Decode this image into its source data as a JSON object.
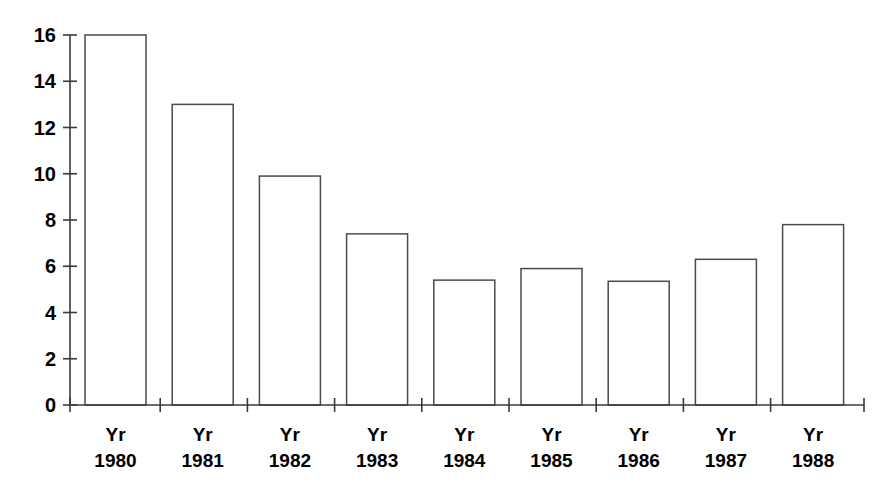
{
  "chart_data": {
    "type": "bar",
    "title": "",
    "subtitle": "",
    "xlabel": "",
    "ylabel": "",
    "categories": [
      "Yr 1980",
      "Yr 1981",
      "Yr 1982",
      "Yr 1983",
      "Yr 1984",
      "Yr 1985",
      "Yr 1986",
      "Yr 1987",
      "Yr 1988"
    ],
    "category_lines": [
      [
        "Yr",
        "1980"
      ],
      [
        "Yr",
        "1981"
      ],
      [
        "Yr",
        "1982"
      ],
      [
        "Yr",
        "1983"
      ],
      [
        "Yr",
        "1984"
      ],
      [
        "Yr",
        "1985"
      ],
      [
        "Yr",
        "1986"
      ],
      [
        "Yr",
        "1987"
      ],
      [
        "Yr",
        "1988"
      ]
    ],
    "values": [
      16.0,
      13.0,
      9.9,
      7.4,
      5.4,
      5.9,
      5.35,
      6.3,
      7.8
    ],
    "ylim": [
      0,
      16
    ],
    "ytick_values": [
      0,
      2,
      4,
      6,
      8,
      10,
      12,
      14,
      16
    ],
    "ytick_labels": [
      "0",
      "2",
      "4",
      "6",
      "8",
      "10",
      "12",
      "14",
      "16"
    ],
    "grid": false,
    "legend": null,
    "legend_position": "none",
    "bar_fill": "#ffffff",
    "bar_stroke": "#4a4a4a",
    "axis_color": "#3a3a3a",
    "background": "#ffffff"
  },
  "layout": {
    "plot_left": 70,
    "plot_right": 864,
    "baseline_y": 405,
    "top_y": 35,
    "bar_width": 61,
    "slot_width": 87.2,
    "first_bar_left": 85
  }
}
